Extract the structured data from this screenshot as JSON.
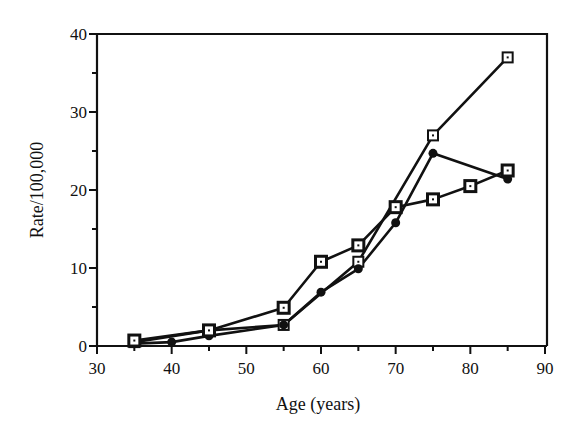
{
  "chart_data": {
    "type": "line",
    "title": "",
    "xlabel": "Age (years)",
    "ylabel": "Rate/100,000",
    "xlim": [
      30,
      90
    ],
    "ylim": [
      0,
      40
    ],
    "x_ticks": [
      30,
      40,
      50,
      60,
      70,
      80,
      90
    ],
    "x_minor_ticks": [
      35,
      45,
      55,
      65,
      75,
      85
    ],
    "y_ticks": [
      0,
      10,
      20,
      30,
      40
    ],
    "y_minor_ticks": [
      5,
      15,
      25,
      35
    ],
    "grid": false,
    "legend": null,
    "series": [
      {
        "name": "Series A (open square markers)",
        "marker": "open-square-dot",
        "x": [
          35,
          45,
          55,
          65,
          75,
          85
        ],
        "values": [
          0.5,
          2.0,
          2.7,
          10.8,
          27.0,
          37.0
        ]
      },
      {
        "name": "Series B (filled circle markers)",
        "marker": "filled-circle",
        "x": [
          35,
          40,
          45,
          55,
          60,
          65,
          70,
          75,
          85
        ],
        "values": [
          0.3,
          0.5,
          1.3,
          2.7,
          6.9,
          9.9,
          15.8,
          24.7,
          21.4
        ]
      },
      {
        "name": "Series C (filled square markers)",
        "marker": "filled-square",
        "x": [
          35,
          45,
          55,
          60,
          65,
          70,
          75,
          80,
          85
        ],
        "values": [
          0.7,
          2.0,
          4.9,
          10.8,
          12.9,
          17.8,
          18.8,
          20.5,
          22.5
        ]
      }
    ]
  }
}
